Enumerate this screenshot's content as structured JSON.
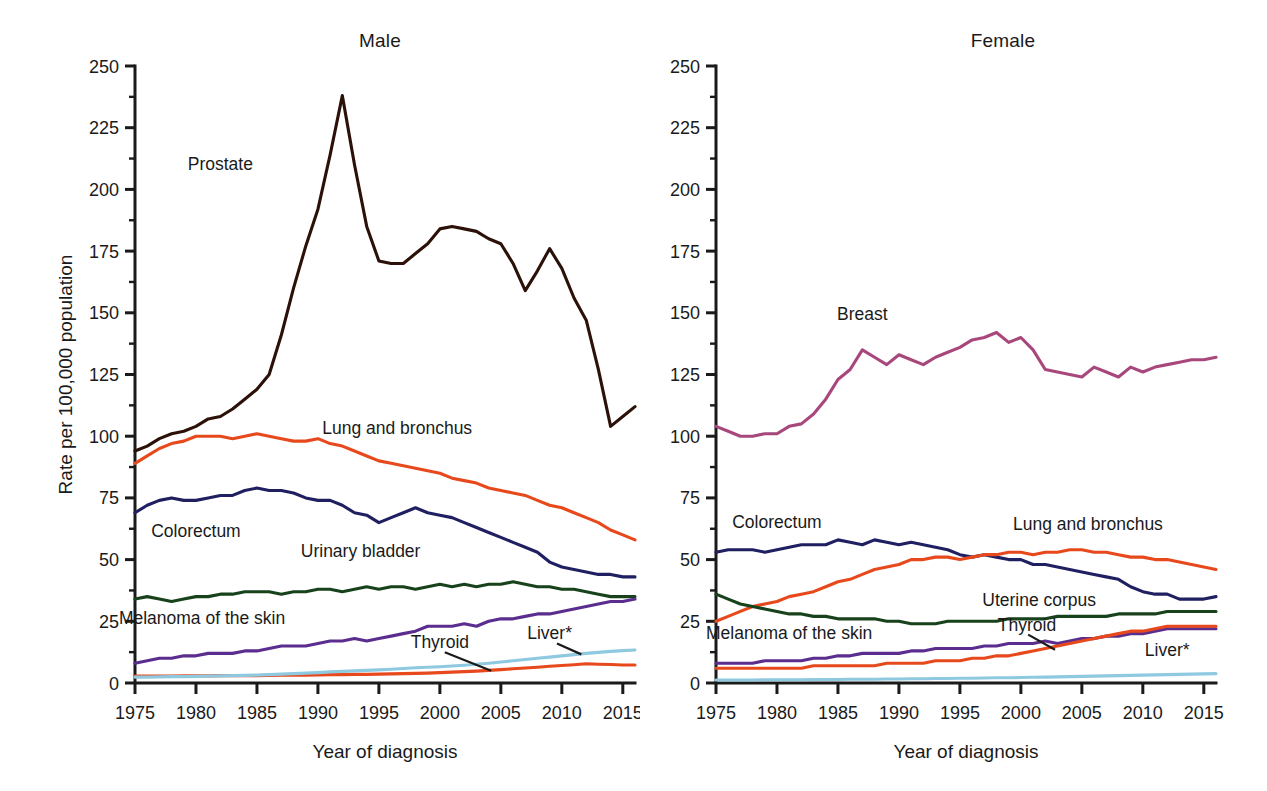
{
  "figure": {
    "background": "#ffffff",
    "xlabel": "Year of diagnosis",
    "ylabel": "Rate per 100,000 population",
    "y_ticks": [
      "0",
      "25",
      "50",
      "75",
      "100",
      "125",
      "150",
      "175",
      "200",
      "225",
      "250"
    ],
    "x_ticks": [
      "1975",
      "1980",
      "1985",
      "1990",
      "1995",
      "2000",
      "2005",
      "2010",
      "2015"
    ],
    "ylim": [
      0,
      250
    ],
    "xlim": [
      1975,
      2016
    ],
    "minor_tick_step": 12.5,
    "grid": false,
    "legend": "none (inline series labels)"
  },
  "panels": [
    {
      "id": "male",
      "title": "Male"
    },
    {
      "id": "female",
      "title": "Female"
    }
  ],
  "colors": {
    "prostate": "#2b1108",
    "breast": "#a8477c",
    "lung": "#e8491c",
    "colorectum": "#1f1f62",
    "urinary_bladder": "#17421c",
    "uterine_corpus": "#17421c",
    "melanoma": "#5b2d8e",
    "thyroid_male": "#e8491c",
    "thyroid_female": "#5b2d8e",
    "liver": "#8fc9e0",
    "axis": "#1a1a1a",
    "text": "#1a1a1a"
  },
  "chart_data": [
    {
      "type": "line",
      "panel": "male",
      "title": "Male",
      "xlabel": "Year of diagnosis",
      "ylabel": "Rate per 100,000 population",
      "xlim": [
        1975,
        2016
      ],
      "ylim": [
        0,
        250
      ],
      "x": [
        1975,
        1976,
        1977,
        1978,
        1979,
        1980,
        1981,
        1982,
        1983,
        1984,
        1985,
        1986,
        1987,
        1988,
        1989,
        1990,
        1991,
        1992,
        1993,
        1994,
        1995,
        1996,
        1997,
        1998,
        1999,
        2000,
        2001,
        2002,
        2003,
        2004,
        2005,
        2006,
        2007,
        2008,
        2009,
        2010,
        2011,
        2012,
        2013,
        2014,
        2015,
        2016
      ],
      "series": [
        {
          "name": "Prostate",
          "color": "#2b1108",
          "label_x": 1982.0,
          "label_y": 208,
          "values": [
            94,
            96,
            99,
            101,
            102,
            104,
            107,
            108,
            111,
            115,
            119,
            125,
            141,
            160,
            177,
            192,
            214,
            238,
            210,
            185,
            171,
            170,
            170,
            174,
            178,
            184,
            185,
            184,
            183,
            180,
            178,
            170,
            159,
            167,
            176,
            168,
            156,
            147,
            127,
            104,
            108,
            112
          ]
        },
        {
          "name": "Lung and bronchus",
          "color": "#e8491c",
          "label_x": 1996.5,
          "label_y": 101,
          "values": [
            89,
            92,
            95,
            97,
            98,
            100,
            100,
            100,
            99,
            100,
            101,
            100,
            99,
            98,
            98,
            99,
            97,
            96,
            94,
            92,
            90,
            89,
            88,
            87,
            86,
            85,
            83,
            82,
            81,
            79,
            78,
            77,
            76,
            74,
            72,
            71,
            69,
            67,
            65,
            62,
            60,
            58
          ]
        },
        {
          "name": "Colorectum",
          "color": "#1f1f62",
          "label_x": 1980.0,
          "label_y": 59,
          "values": [
            69,
            72,
            74,
            75,
            74,
            74,
            75,
            76,
            76,
            78,
            79,
            78,
            78,
            77,
            75,
            74,
            74,
            72,
            69,
            68,
            65,
            67,
            69,
            71,
            69,
            68,
            67,
            65,
            63,
            61,
            59,
            57,
            55,
            53,
            49,
            47,
            46,
            45,
            44,
            44,
            43,
            43
          ]
        },
        {
          "name": "Urinary bladder",
          "color": "#17421c",
          "label_x": 1993.5,
          "label_y": 51,
          "values": [
            34,
            35,
            34,
            33,
            34,
            35,
            35,
            36,
            36,
            37,
            37,
            37,
            36,
            37,
            37,
            38,
            38,
            37,
            38,
            39,
            38,
            39,
            39,
            38,
            39,
            40,
            39,
            40,
            39,
            40,
            40,
            41,
            40,
            39,
            39,
            38,
            38,
            37,
            36,
            35,
            35,
            35
          ]
        },
        {
          "name": "Melanoma of the skin",
          "color": "#5b2d8e",
          "label_x": 1980.5,
          "label_y": 24,
          "values": [
            8,
            9,
            10,
            10,
            11,
            11,
            12,
            12,
            12,
            13,
            13,
            14,
            15,
            15,
            15,
            16,
            17,
            17,
            18,
            17,
            18,
            19,
            20,
            21,
            23,
            23,
            23,
            24,
            23,
            25,
            26,
            26,
            27,
            28,
            28,
            29,
            30,
            31,
            32,
            33,
            33,
            34
          ]
        },
        {
          "name": "Thyroid",
          "color": "#e8491c",
          "label_x": 2000.0,
          "label_y": 14,
          "values": [
            2.8,
            2.8,
            2.8,
            2.8,
            2.9,
            2.9,
            2.9,
            3.0,
            3.0,
            3.0,
            3.0,
            3.1,
            3.2,
            3.2,
            3.2,
            3.3,
            3.4,
            3.4,
            3.5,
            3.5,
            3.6,
            3.7,
            3.8,
            3.9,
            4.0,
            4.2,
            4.4,
            4.6,
            4.8,
            5.1,
            5.4,
            5.8,
            6.1,
            6.4,
            6.8,
            7.1,
            7.4,
            7.8,
            7.6,
            7.5,
            7.3,
            7.3
          ]
        },
        {
          "name": "Liver*",
          "color": "#8fc9e0",
          "label_x": 2009.0,
          "label_y": 18,
          "values": [
            2.4,
            2.4,
            2.5,
            2.6,
            2.6,
            2.7,
            2.8,
            2.9,
            3.0,
            3.1,
            3.2,
            3.4,
            3.6,
            3.8,
            4.0,
            4.2,
            4.5,
            4.7,
            4.9,
            5.1,
            5.3,
            5.6,
            5.9,
            6.2,
            6.4,
            6.6,
            6.9,
            7.2,
            7.6,
            8.0,
            8.5,
            9.0,
            9.5,
            10.0,
            10.5,
            11.0,
            11.5,
            12.0,
            12.4,
            12.8,
            13.1,
            13.4
          ]
        }
      ]
    },
    {
      "type": "line",
      "panel": "female",
      "title": "Female",
      "xlabel": "Year of diagnosis",
      "ylabel": "Rate per 100,000 population",
      "xlim": [
        1975,
        2016
      ],
      "ylim": [
        0,
        250
      ],
      "x": [
        1975,
        1976,
        1977,
        1978,
        1979,
        1980,
        1981,
        1982,
        1983,
        1984,
        1985,
        1986,
        1987,
        1988,
        1989,
        1990,
        1991,
        1992,
        1993,
        1994,
        1995,
        1996,
        1997,
        1998,
        1999,
        2000,
        2001,
        2002,
        2003,
        2004,
        2005,
        2006,
        2007,
        2008,
        2009,
        2010,
        2011,
        2012,
        2013,
        2014,
        2015,
        2016
      ],
      "series": [
        {
          "name": "Breast",
          "color": "#a8477c",
          "label_x": 1987.0,
          "label_y": 147,
          "values": [
            104,
            102,
            100,
            100,
            101,
            101,
            104,
            105,
            109,
            115,
            123,
            127,
            135,
            132,
            129,
            133,
            131,
            129,
            132,
            134,
            136,
            139,
            140,
            142,
            138,
            140,
            135,
            127,
            126,
            125,
            124,
            128,
            126,
            124,
            128,
            126,
            128,
            129,
            130,
            131,
            131,
            132
          ]
        },
        {
          "name": "Colorectum",
          "color": "#1f1f62",
          "label_x": 1980.0,
          "label_y": 63,
          "values": [
            53,
            54,
            54,
            54,
            53,
            54,
            55,
            56,
            56,
            56,
            58,
            57,
            56,
            58,
            57,
            56,
            57,
            56,
            55,
            54,
            52,
            51,
            52,
            51,
            50,
            50,
            48,
            48,
            47,
            46,
            45,
            44,
            43,
            42,
            39,
            37,
            36,
            36,
            34,
            34,
            34,
            35
          ]
        },
        {
          "name": "Lung and bronchus",
          "color": "#e8491c",
          "label_x": 2005.5,
          "label_y": 62,
          "values": [
            25,
            27,
            29,
            31,
            32,
            33,
            35,
            36,
            37,
            39,
            41,
            42,
            44,
            46,
            47,
            48,
            50,
            50,
            51,
            51,
            50,
            51,
            52,
            52,
            53,
            53,
            52,
            53,
            53,
            54,
            54,
            53,
            53,
            52,
            51,
            51,
            50,
            50,
            49,
            48,
            47,
            46
          ]
        },
        {
          "name": "Uterine corpus",
          "color": "#17421c",
          "label_x": 2001.5,
          "label_y": 31,
          "values": [
            36,
            34,
            32,
            31,
            30,
            29,
            28,
            28,
            27,
            27,
            26,
            26,
            26,
            26,
            25,
            25,
            24,
            24,
            24,
            25,
            25,
            25,
            25,
            25,
            26,
            26,
            26,
            26,
            27,
            27,
            27,
            27,
            27,
            28,
            28,
            28,
            28,
            29,
            29,
            29,
            29,
            29
          ]
        },
        {
          "name": "Melanoma of the skin",
          "color": "#5b2d8e",
          "label_x": 1981.0,
          "label_y": 18,
          "values": [
            8,
            8,
            8,
            8,
            9,
            9,
            9,
            9,
            10,
            10,
            11,
            11,
            12,
            12,
            12,
            12,
            13,
            13,
            14,
            14,
            14,
            14,
            15,
            15,
            16,
            16,
            16,
            17,
            16,
            17,
            18,
            18,
            19,
            19,
            20,
            20,
            21,
            22,
            22,
            22,
            22,
            22
          ]
        },
        {
          "name": "Thyroid",
          "color": "#e8491c",
          "label_x": 2000.5,
          "label_y": 21,
          "values": [
            6,
            6,
            6,
            6,
            6,
            6,
            6,
            6,
            7,
            7,
            7,
            7,
            7,
            7,
            8,
            8,
            8,
            8,
            9,
            9,
            9,
            10,
            10,
            11,
            11,
            12,
            13,
            14,
            15,
            16,
            17,
            18,
            19,
            20,
            21,
            21,
            22,
            23,
            23,
            23,
            23,
            23
          ]
        },
        {
          "name": "Liver*",
          "color": "#8fc9e0",
          "label_x": 2012.0,
          "label_y": 11,
          "values": [
            1.2,
            1.2,
            1.2,
            1.2,
            1.3,
            1.3,
            1.3,
            1.3,
            1.4,
            1.4,
            1.4,
            1.5,
            1.5,
            1.5,
            1.6,
            1.6,
            1.7,
            1.7,
            1.8,
            1.8,
            1.9,
            1.9,
            2.0,
            2.1,
            2.1,
            2.2,
            2.3,
            2.4,
            2.5,
            2.6,
            2.7,
            2.8,
            2.9,
            3.0,
            3.1,
            3.2,
            3.3,
            3.4,
            3.5,
            3.6,
            3.7,
            3.8
          ]
        }
      ]
    }
  ],
  "leader_lines": [
    {
      "panel": "male",
      "from_name": "thyroid-leader",
      "x1": 2000.4,
      "y1": 12.5,
      "x2": 2004.2,
      "y2": 5.0
    },
    {
      "panel": "male",
      "from_name": "liver-leader",
      "x1": 2009.6,
      "y1": 16.0,
      "x2": 2011.6,
      "y2": 11.6
    },
    {
      "panel": "female",
      "from_name": "thyroid-leader",
      "x1": 2000.6,
      "y1": 19.6,
      "x2": 2002.8,
      "y2": 13.5
    }
  ]
}
